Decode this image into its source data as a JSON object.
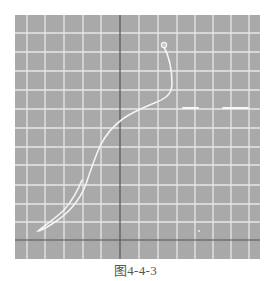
{
  "figure": {
    "caption": "图4-4-3",
    "background_color": "#a9a9a9",
    "grid_color": "#eeeeee",
    "axis_color": "#555555",
    "curve_color": "#f4f4f4"
  },
  "chart_data": {
    "type": "line",
    "title": "",
    "caption": "图4-4-3",
    "xlabel": "",
    "ylabel": "",
    "grid": true,
    "legend": null,
    "plot_area_px": {
      "left": 15,
      "top": 15,
      "right": 260,
      "bottom": 259
    },
    "grid_x_px": [
      27,
      45,
      64,
      83,
      101,
      139,
      158,
      177,
      195,
      213,
      231,
      249
    ],
    "grid_y_px": [
      33,
      52,
      71,
      90,
      109,
      128,
      147,
      165,
      185,
      204,
      222
    ],
    "axes_px": {
      "vertical_x": 120,
      "horizontal_y": 240
    },
    "units": "grid divisions relative to axes origin (x right, y up)",
    "series": [
      {
        "name": "trace",
        "points": [
          [
            2.4,
            10.2
          ],
          [
            2.7,
            9.2
          ],
          [
            2.8,
            8.2
          ],
          [
            2.6,
            7.8
          ],
          [
            1.6,
            7.3
          ],
          [
            0.8,
            6.8
          ],
          [
            0.4,
            6.6
          ],
          [
            -0.4,
            6.0
          ],
          [
            -0.9,
            5.3
          ],
          [
            -1.3,
            4.5
          ],
          [
            -1.6,
            3.7
          ],
          [
            -2.0,
            2.6
          ],
          [
            -2.6,
            1.7
          ],
          [
            -3.7,
            0.9
          ],
          [
            -4.4,
            0.5
          ],
          [
            -3.5,
            1.1
          ],
          [
            -2.7,
            1.9
          ],
          [
            -2.1,
            2.8
          ],
          [
            -1.8,
            3.6
          ]
        ],
        "start_marker": "circle"
      }
    ],
    "annotations": [
      {
        "type": "highlight-dash",
        "y": 7.0,
        "x_from": 3.4,
        "x_to": 4.2
      },
      {
        "type": "highlight-dash",
        "y": 7.0,
        "x_from": 5.4,
        "x_to": 6.8
      }
    ]
  }
}
